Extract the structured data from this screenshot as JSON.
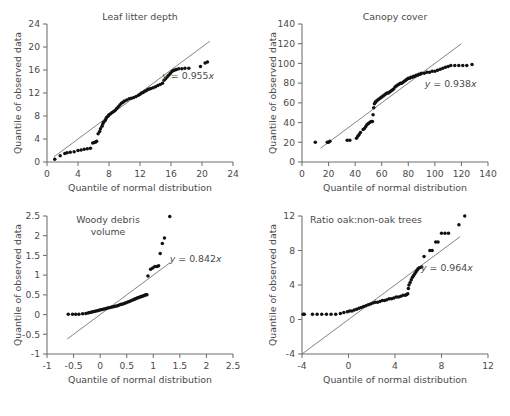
{
  "figure": {
    "caption_fragment": ""
  },
  "shared": {
    "xlabel": "Quantile of normal distribution",
    "ylabel": "Quantile of observed data"
  },
  "chart_data": [
    {
      "id": "leaf-litter-depth",
      "type": "scatter",
      "title": "Leaf litter depth",
      "xlabel": "Quantile of normal distribution",
      "ylabel": "Quantile of observed data",
      "xlim": [
        0,
        24
      ],
      "ylim": [
        0,
        24
      ],
      "xticks": [
        0,
        4,
        8,
        12,
        16,
        20,
        24
      ],
      "yticks": [
        0,
        4,
        8,
        12,
        16,
        20,
        24
      ],
      "grid": false,
      "annotation": "y = 0.955x",
      "annotation_slope": 0.955,
      "reference_line": {
        "slope": 1,
        "intercept": 0,
        "x_from": 0.9,
        "x_to": 21.0
      },
      "points": [
        [
          1.0,
          0.5
        ],
        [
          1.7,
          1.1
        ],
        [
          2.3,
          1.5
        ],
        [
          2.6,
          1.6
        ],
        [
          3.0,
          1.7
        ],
        [
          3.5,
          1.8
        ],
        [
          4.0,
          2.0
        ],
        [
          4.4,
          2.1
        ],
        [
          4.8,
          2.2
        ],
        [
          5.2,
          2.3
        ],
        [
          5.6,
          2.4
        ],
        [
          5.9,
          3.3
        ],
        [
          6.1,
          3.4
        ],
        [
          6.3,
          3.5
        ],
        [
          6.4,
          3.6
        ],
        [
          6.6,
          4.9
        ],
        [
          6.8,
          5.3
        ],
        [
          6.9,
          5.8
        ],
        [
          7.1,
          6.2
        ],
        [
          7.2,
          6.6
        ],
        [
          7.3,
          6.9
        ],
        [
          7.5,
          7.2
        ],
        [
          7.6,
          7.5
        ],
        [
          7.7,
          7.8
        ],
        [
          7.9,
          8.0
        ],
        [
          8.0,
          8.2
        ],
        [
          8.2,
          8.4
        ],
        [
          8.4,
          8.6
        ],
        [
          8.6,
          8.8
        ],
        [
          8.8,
          9.0
        ],
        [
          9.0,
          9.3
        ],
        [
          9.2,
          9.6
        ],
        [
          9.4,
          9.9
        ],
        [
          9.6,
          10.2
        ],
        [
          9.8,
          10.4
        ],
        [
          10.0,
          10.6
        ],
        [
          10.3,
          10.8
        ],
        [
          10.6,
          11.0
        ],
        [
          10.9,
          11.1
        ],
        [
          11.2,
          11.2
        ],
        [
          11.5,
          11.4
        ],
        [
          11.8,
          11.6
        ],
        [
          12.0,
          11.8
        ],
        [
          12.2,
          12.0
        ],
        [
          12.4,
          12.1
        ],
        [
          12.6,
          12.3
        ],
        [
          12.8,
          12.4
        ],
        [
          13.0,
          12.6
        ],
        [
          13.2,
          12.7
        ],
        [
          13.4,
          12.8
        ],
        [
          13.7,
          12.9
        ],
        [
          14.0,
          13.1
        ],
        [
          14.3,
          13.3
        ],
        [
          14.6,
          13.5
        ],
        [
          14.9,
          13.7
        ],
        [
          15.1,
          14.2
        ],
        [
          15.3,
          14.5
        ],
        [
          15.5,
          14.8
        ],
        [
          15.7,
          15.1
        ],
        [
          15.9,
          15.4
        ],
        [
          16.1,
          15.7
        ],
        [
          16.3,
          15.9
        ],
        [
          16.5,
          16.0
        ],
        [
          16.7,
          16.1
        ],
        [
          17.0,
          16.2
        ],
        [
          17.4,
          16.2
        ],
        [
          17.8,
          16.3
        ],
        [
          18.3,
          16.3
        ],
        [
          19.8,
          16.6
        ],
        [
          20.4,
          17.2
        ],
        [
          20.7,
          17.4
        ]
      ]
    },
    {
      "id": "canopy-cover",
      "type": "scatter",
      "title": "Canopy cover",
      "xlabel": "Quantile of normal distribution",
      "ylabel": "Quantile of observed data",
      "xlim": [
        0,
        140
      ],
      "ylim": [
        0,
        140
      ],
      "xticks": [
        0,
        20,
        40,
        60,
        80,
        100,
        120,
        140
      ],
      "yticks": [
        0,
        20,
        40,
        60,
        80,
        100,
        120,
        140
      ],
      "grid": false,
      "annotation": "y = 0.938x",
      "annotation_slope": 0.938,
      "reference_line": {
        "slope": 1,
        "intercept": 0,
        "x_from": 14,
        "x_to": 120
      },
      "points": [
        [
          10,
          20
        ],
        [
          19,
          20
        ],
        [
          20,
          20
        ],
        [
          21,
          21
        ],
        [
          34,
          22
        ],
        [
          36,
          22
        ],
        [
          41,
          24
        ],
        [
          42,
          26
        ],
        [
          43,
          28
        ],
        [
          44,
          30
        ],
        [
          46,
          33
        ],
        [
          47,
          34
        ],
        [
          48,
          36
        ],
        [
          49,
          38
        ],
        [
          50,
          39
        ],
        [
          51,
          40
        ],
        [
          52,
          41
        ],
        [
          53,
          41
        ],
        [
          53.5,
          48
        ],
        [
          54,
          55
        ],
        [
          54.5,
          59
        ],
        [
          55,
          60
        ],
        [
          55.5,
          61
        ],
        [
          56,
          62
        ],
        [
          57,
          63
        ],
        [
          58,
          64
        ],
        [
          59,
          65
        ],
        [
          60,
          66
        ],
        [
          61,
          67
        ],
        [
          62,
          68
        ],
        [
          63,
          69
        ],
        [
          64,
          70
        ],
        [
          65,
          70
        ],
        [
          66,
          71
        ],
        [
          67,
          72
        ],
        [
          68,
          73
        ],
        [
          69,
          74
        ],
        [
          70,
          76
        ],
        [
          71,
          77
        ],
        [
          72,
          78
        ],
        [
          73,
          79
        ],
        [
          74,
          80
        ],
        [
          75,
          80
        ],
        [
          76,
          81
        ],
        [
          77,
          82
        ],
        [
          78,
          83
        ],
        [
          79,
          84
        ],
        [
          80,
          85
        ],
        [
          81,
          85
        ],
        [
          82,
          86
        ],
        [
          83,
          86
        ],
        [
          84,
          87
        ],
        [
          85,
          87
        ],
        [
          86,
          88
        ],
        [
          87,
          88
        ],
        [
          88,
          89
        ],
        [
          89,
          89
        ],
        [
          90,
          90
        ],
        [
          92,
          90
        ],
        [
          94,
          91
        ],
        [
          96,
          91
        ],
        [
          98,
          92
        ],
        [
          100,
          92
        ],
        [
          102,
          93
        ],
        [
          104,
          94
        ],
        [
          106,
          95
        ],
        [
          108,
          96
        ],
        [
          110,
          97
        ],
        [
          112,
          98
        ],
        [
          115,
          98
        ],
        [
          118,
          98
        ],
        [
          121,
          98
        ],
        [
          124,
          98
        ],
        [
          128,
          99
        ]
      ]
    },
    {
      "id": "woody-debris-volume",
      "type": "scatter",
      "title": "Woody debris volume",
      "title_line1": "Woody debris",
      "title_line2": "volume",
      "xlabel": "Quantile of normal distribution",
      "ylabel": "Quantile of observed data",
      "xlim": [
        -1,
        2.5
      ],
      "ylim": [
        -1,
        2.5
      ],
      "xticks": [
        -1,
        -0.5,
        0,
        0.5,
        1,
        1.5,
        2,
        2.5
      ],
      "yticks": [
        -1,
        -0.5,
        0,
        0.5,
        1,
        1.5,
        2,
        2.5
      ],
      "grid": false,
      "annotation": "y = 0.842x",
      "annotation_slope": 0.842,
      "reference_line": {
        "slope": 1,
        "intercept": 0,
        "x_from": -0.62,
        "x_to": 1.32
      },
      "points": [
        [
          -0.6,
          0.01
        ],
        [
          -0.52,
          0.01
        ],
        [
          -0.46,
          0.01
        ],
        [
          -0.4,
          0.01
        ],
        [
          -0.33,
          0.02
        ],
        [
          -0.27,
          0.03
        ],
        [
          -0.23,
          0.04
        ],
        [
          -0.2,
          0.05
        ],
        [
          -0.17,
          0.06
        ],
        [
          -0.14,
          0.07
        ],
        [
          -0.11,
          0.08
        ],
        [
          -0.08,
          0.09
        ],
        [
          -0.05,
          0.1
        ],
        [
          -0.02,
          0.11
        ],
        [
          0.01,
          0.12
        ],
        [
          0.04,
          0.13
        ],
        [
          0.07,
          0.14
        ],
        [
          0.1,
          0.15
        ],
        [
          0.13,
          0.16
        ],
        [
          0.16,
          0.17
        ],
        [
          0.19,
          0.18
        ],
        [
          0.22,
          0.19
        ],
        [
          0.25,
          0.2
        ],
        [
          0.28,
          0.21
        ],
        [
          0.31,
          0.22
        ],
        [
          0.34,
          0.23
        ],
        [
          0.37,
          0.25
        ],
        [
          0.4,
          0.26
        ],
        [
          0.43,
          0.27
        ],
        [
          0.46,
          0.29
        ],
        [
          0.49,
          0.3
        ],
        [
          0.52,
          0.32
        ],
        [
          0.55,
          0.33
        ],
        [
          0.58,
          0.35
        ],
        [
          0.61,
          0.37
        ],
        [
          0.64,
          0.38
        ],
        [
          0.66,
          0.4
        ],
        [
          0.68,
          0.41
        ],
        [
          0.7,
          0.42
        ],
        [
          0.72,
          0.43
        ],
        [
          0.74,
          0.44
        ],
        [
          0.76,
          0.45
        ],
        [
          0.78,
          0.46
        ],
        [
          0.8,
          0.47
        ],
        [
          0.82,
          0.48
        ],
        [
          0.84,
          0.49
        ],
        [
          0.86,
          0.5
        ],
        [
          0.88,
          0.5
        ],
        [
          0.9,
          0.98
        ],
        [
          0.95,
          1.15
        ],
        [
          0.99,
          1.18
        ],
        [
          1.03,
          1.22
        ],
        [
          1.07,
          1.22
        ],
        [
          1.1,
          1.24
        ],
        [
          1.13,
          1.55
        ],
        [
          1.17,
          1.8
        ],
        [
          1.21,
          1.94
        ],
        [
          1.31,
          2.49
        ]
      ]
    },
    {
      "id": "ratio-oak-non-oak-trees",
      "type": "scatter",
      "title": "Ratio oak:non-oak trees",
      "xlabel": "Quantile of normal distribution",
      "ylabel": "Quantile of observed data",
      "xlim": [
        -4,
        12
      ],
      "ylim": [
        -4,
        12
      ],
      "xticks": [
        -4,
        0,
        4,
        8,
        12
      ],
      "yticks": [
        -4,
        0,
        4,
        8,
        12
      ],
      "grid": false,
      "annotation": "y = 0.964x",
      "annotation_slope": 0.964,
      "reference_line": {
        "slope": 1,
        "intercept": 0,
        "x_from": -4.0,
        "x_to": 9.6
      },
      "points": [
        [
          -3.9,
          0.6
        ],
        [
          -3.8,
          0.6
        ],
        [
          -3.1,
          0.6
        ],
        [
          -2.7,
          0.6
        ],
        [
          -2.3,
          0.6
        ],
        [
          -1.9,
          0.6
        ],
        [
          -1.5,
          0.6
        ],
        [
          -1.1,
          0.6
        ],
        [
          -0.7,
          0.7
        ],
        [
          -0.4,
          0.8
        ],
        [
          -0.1,
          0.9
        ],
        [
          0.1,
          1.0
        ],
        [
          0.3,
          1.0
        ],
        [
          0.5,
          1.1
        ],
        [
          0.7,
          1.2
        ],
        [
          0.9,
          1.3
        ],
        [
          1.1,
          1.4
        ],
        [
          1.3,
          1.5
        ],
        [
          1.5,
          1.6
        ],
        [
          1.7,
          1.7
        ],
        [
          1.9,
          1.8
        ],
        [
          2.1,
          1.9
        ],
        [
          2.3,
          2.0
        ],
        [
          2.5,
          2.0
        ],
        [
          2.7,
          2.1
        ],
        [
          2.9,
          2.2
        ],
        [
          3.1,
          2.2
        ],
        [
          3.3,
          2.3
        ],
        [
          3.5,
          2.4
        ],
        [
          3.7,
          2.4
        ],
        [
          3.9,
          2.5
        ],
        [
          4.1,
          2.6
        ],
        [
          4.3,
          2.6
        ],
        [
          4.5,
          2.7
        ],
        [
          4.7,
          2.8
        ],
        [
          4.9,
          2.8
        ],
        [
          5.0,
          2.9
        ],
        [
          5.1,
          3.0
        ],
        [
          5.15,
          3.6
        ],
        [
          5.2,
          4.0
        ],
        [
          5.3,
          4.3
        ],
        [
          5.4,
          4.6
        ],
        [
          5.5,
          4.9
        ],
        [
          5.6,
          5.1
        ],
        [
          5.7,
          5.3
        ],
        [
          5.8,
          5.5
        ],
        [
          5.9,
          5.7
        ],
        [
          6.0,
          5.9
        ],
        [
          6.1,
          6.0
        ],
        [
          6.3,
          6.1
        ],
        [
          6.5,
          7.3
        ],
        [
          7.0,
          8.0
        ],
        [
          7.2,
          8.0
        ],
        [
          7.5,
          9.0
        ],
        [
          7.7,
          9.0
        ],
        [
          8.0,
          10.0
        ],
        [
          8.3,
          10.0
        ],
        [
          8.6,
          10.0
        ],
        [
          9.5,
          11.0
        ],
        [
          10.0,
          12.0
        ]
      ]
    }
  ]
}
